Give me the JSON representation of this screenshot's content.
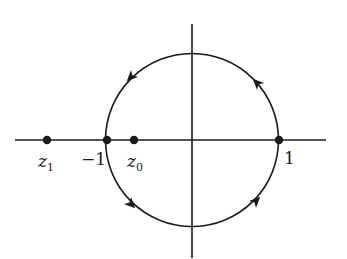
{
  "diagram": {
    "type": "contour-plot",
    "contour": "unit circle, counterclockwise",
    "points": [
      {
        "name": "z1",
        "label": "z",
        "subscript": "1",
        "x": 47
      },
      {
        "name": "minus-one",
        "label": "−1",
        "x": 107
      },
      {
        "name": "z0",
        "label": "z",
        "subscript": "0",
        "x": 134
      },
      {
        "name": "one",
        "label": "1",
        "x": 279
      }
    ],
    "colors": {
      "ink": "#1a1a1a",
      "background": "#ffffff"
    }
  }
}
